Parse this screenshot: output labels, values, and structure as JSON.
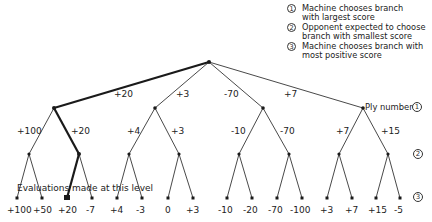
{
  "legend": {
    "items": [
      {
        "marker": "1",
        "text": [
          "Machine chooses branch",
          "with largest score"
        ]
      },
      {
        "marker": "2",
        "text": [
          "Opponent expected to choose",
          "branch with smallest score"
        ]
      },
      {
        "marker": "3",
        "text": [
          "Machine chooses branch with",
          "most positive score"
        ]
      }
    ]
  },
  "ply_label": "Ply number",
  "ply_markers": [
    "1",
    "2",
    "3"
  ],
  "evaluation_note": "Evaluations made at this level",
  "tree": {
    "root_value": "+20",
    "level1_branch_labels": [
      "+20",
      "+3",
      "-70",
      "+7"
    ],
    "level2_branch_labels": [
      "+100",
      "+20",
      "+4",
      "+3",
      "-10",
      "-70",
      "+7",
      "+15"
    ],
    "leaf_values": [
      "+100",
      "+50",
      "+20",
      "-7",
      "+4",
      "-3",
      "0",
      "+3",
      "-10",
      "-20",
      "-70",
      "-100",
      "+3",
      "+7",
      "+15",
      "-5"
    ],
    "chosen_path": [
      "root",
      "L1-0 (+20)",
      "L2-1 (+20)",
      "leaf +20"
    ]
  },
  "colors": {
    "line": "#1a1a1a",
    "background": "#ffffff"
  }
}
